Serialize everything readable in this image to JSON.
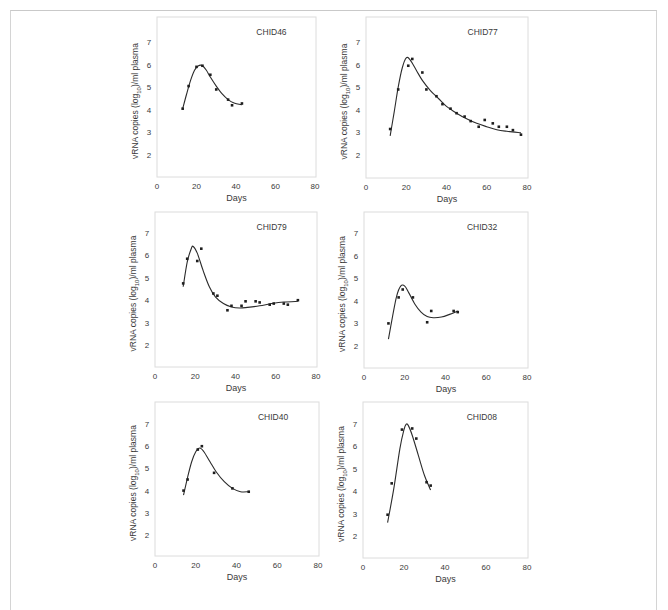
{
  "figure": {
    "xlabel": "Days",
    "ylabel_prefix": "vRNA copies (log",
    "ylabel_sub": "10",
    "ylabel_suffix": ")/ml plasma"
  },
  "chart_data": [
    {
      "type": "scatter",
      "title": "CHID46",
      "xlabel": "Days",
      "ylabel": "vRNA copies (log10)/ml plasma",
      "xlim": [
        0,
        80
      ],
      "ylim": [
        1,
        8
      ],
      "xticks": [
        0,
        20,
        40,
        60,
        80
      ],
      "yticks": [
        2,
        3,
        4,
        5,
        6,
        7
      ],
      "grid": false,
      "points": [
        [
          13,
          4.05
        ],
        [
          16,
          5.05
        ],
        [
          20,
          5.9
        ],
        [
          23,
          5.95
        ],
        [
          27,
          5.55
        ],
        [
          30,
          4.9
        ],
        [
          36,
          4.45
        ],
        [
          38,
          4.2
        ],
        [
          43,
          4.28
        ]
      ],
      "fit": [
        [
          13,
          4.05
        ],
        [
          15,
          4.7
        ],
        [
          17,
          5.3
        ],
        [
          19,
          5.75
        ],
        [
          21,
          5.95
        ],
        [
          23,
          5.95
        ],
        [
          25,
          5.75
        ],
        [
          27,
          5.45
        ],
        [
          30,
          5.05
        ],
        [
          33,
          4.7
        ],
        [
          36,
          4.45
        ],
        [
          39,
          4.3
        ],
        [
          43,
          4.22
        ]
      ]
    },
    {
      "type": "scatter",
      "title": "CHID77",
      "xlabel": "Days",
      "ylabel": "vRNA copies (log10)/ml plasma",
      "xlim": [
        0,
        80
      ],
      "ylim": [
        1,
        8
      ],
      "xticks": [
        0,
        20,
        40,
        60,
        80
      ],
      "yticks": [
        2,
        3,
        4,
        5,
        6,
        7
      ],
      "grid": false,
      "points": [
        [
          12,
          3.15
        ],
        [
          16,
          4.9
        ],
        [
          21,
          5.95
        ],
        [
          23,
          6.25
        ],
        [
          28,
          5.65
        ],
        [
          30,
          4.9
        ],
        [
          35,
          4.6
        ],
        [
          38,
          4.25
        ],
        [
          42,
          4.05
        ],
        [
          45,
          3.85
        ],
        [
          49,
          3.7
        ],
        [
          52,
          3.5
        ],
        [
          56,
          3.25
        ],
        [
          59,
          3.55
        ],
        [
          63,
          3.4
        ],
        [
          66,
          3.25
        ],
        [
          70,
          3.25
        ],
        [
          73,
          3.1
        ],
        [
          77,
          2.9
        ]
      ],
      "fit": [
        [
          12,
          2.85
        ],
        [
          14,
          3.9
        ],
        [
          16,
          5.0
        ],
        [
          18,
          5.85
        ],
        [
          20,
          6.3
        ],
        [
          22,
          6.2
        ],
        [
          25,
          5.75
        ],
        [
          28,
          5.3
        ],
        [
          32,
          4.85
        ],
        [
          36,
          4.5
        ],
        [
          40,
          4.15
        ],
        [
          45,
          3.85
        ],
        [
          50,
          3.6
        ],
        [
          55,
          3.4
        ],
        [
          60,
          3.25
        ],
        [
          65,
          3.12
        ],
        [
          70,
          3.05
        ],
        [
          77,
          2.98
        ]
      ]
    },
    {
      "type": "scatter",
      "title": "CHID79",
      "xlabel": "Days",
      "ylabel": "vRNA copies (log10)/ml plasma",
      "xlim": [
        0,
        80
      ],
      "ylim": [
        1,
        8
      ],
      "xticks": [
        0,
        20,
        40,
        60,
        80
      ],
      "yticks": [
        2,
        3,
        4,
        5,
        6,
        7
      ],
      "grid": false,
      "points": [
        [
          14,
          4.75
        ],
        [
          16,
          5.85
        ],
        [
          21,
          5.75
        ],
        [
          23,
          6.3
        ],
        [
          29,
          4.3
        ],
        [
          31,
          4.2
        ],
        [
          36,
          3.55
        ],
        [
          38,
          3.75
        ],
        [
          43,
          3.75
        ],
        [
          45,
          3.95
        ],
        [
          50,
          3.95
        ],
        [
          52,
          3.9
        ],
        [
          57,
          3.8
        ],
        [
          59,
          3.85
        ],
        [
          64,
          3.85
        ],
        [
          66,
          3.8
        ],
        [
          71,
          4.0
        ]
      ],
      "fit": [
        [
          14,
          4.6
        ],
        [
          16,
          5.7
        ],
        [
          18,
          6.3
        ],
        [
          19,
          6.4
        ],
        [
          21,
          6.1
        ],
        [
          24,
          5.3
        ],
        [
          27,
          4.6
        ],
        [
          30,
          4.15
        ],
        [
          34,
          3.85
        ],
        [
          38,
          3.7
        ],
        [
          42,
          3.65
        ],
        [
          46,
          3.68
        ],
        [
          52,
          3.75
        ],
        [
          58,
          3.85
        ],
        [
          64,
          3.92
        ],
        [
          71,
          3.95
        ]
      ]
    },
    {
      "type": "scatter",
      "title": "CHID32",
      "xlabel": "Days",
      "ylabel": "vRNA copies (log10)/ml plasma",
      "xlim": [
        0,
        80
      ],
      "ylim": [
        1,
        8
      ],
      "xticks": [
        0,
        20,
        40,
        60,
        80
      ],
      "yticks": [
        2,
        3,
        4,
        5,
        6,
        7
      ],
      "grid": false,
      "points": [
        [
          12,
          3.0
        ],
        [
          17,
          4.15
        ],
        [
          19,
          4.5
        ],
        [
          24,
          4.15
        ],
        [
          31,
          3.05
        ],
        [
          33,
          3.55
        ],
        [
          44,
          3.55
        ],
        [
          46,
          3.5
        ]
      ],
      "fit": [
        [
          12,
          2.3
        ],
        [
          14,
          3.3
        ],
        [
          16,
          4.2
        ],
        [
          18,
          4.65
        ],
        [
          20,
          4.65
        ],
        [
          22,
          4.35
        ],
        [
          25,
          3.85
        ],
        [
          28,
          3.5
        ],
        [
          31,
          3.3
        ],
        [
          34,
          3.25
        ],
        [
          38,
          3.28
        ],
        [
          42,
          3.4
        ],
        [
          46,
          3.55
        ]
      ]
    },
    {
      "type": "scatter",
      "title": "CHID40",
      "xlabel": "Days",
      "ylabel": "vRNA copies (log10)/ml plasma",
      "xlim": [
        0,
        80
      ],
      "ylim": [
        1,
        8
      ],
      "xticks": [
        0,
        20,
        40,
        60,
        80
      ],
      "yticks": [
        2,
        3,
        4,
        5,
        6,
        7
      ],
      "grid": false,
      "points": [
        [
          14,
          4.0
        ],
        [
          16,
          4.5
        ],
        [
          21,
          5.85
        ],
        [
          23,
          6.0
        ],
        [
          29,
          4.8
        ],
        [
          38,
          4.1
        ],
        [
          46,
          3.95
        ]
      ],
      "fit": [
        [
          14,
          3.8
        ],
        [
          16,
          4.6
        ],
        [
          18,
          5.3
        ],
        [
          20,
          5.75
        ],
        [
          22,
          5.92
        ],
        [
          24,
          5.75
        ],
        [
          27,
          5.3
        ],
        [
          30,
          4.85
        ],
        [
          34,
          4.4
        ],
        [
          38,
          4.1
        ],
        [
          42,
          3.95
        ],
        [
          46,
          3.95
        ]
      ]
    },
    {
      "type": "scatter",
      "title": "CHID08",
      "xlabel": "Days",
      "ylabel": "vRNA copies (log10)/ml plasma",
      "xlim": [
        0,
        80
      ],
      "ylim": [
        1,
        8
      ],
      "xticks": [
        0,
        20,
        40,
        60,
        80
      ],
      "yticks": [
        2,
        3,
        4,
        5,
        6,
        7
      ],
      "grid": false,
      "points": [
        [
          12,
          2.95
        ],
        [
          14,
          4.35
        ],
        [
          19,
          6.75
        ],
        [
          24,
          6.8
        ],
        [
          26,
          6.35
        ],
        [
          31,
          4.4
        ],
        [
          33,
          4.25
        ]
      ],
      "fit": [
        [
          12,
          2.6
        ],
        [
          15,
          4.1
        ],
        [
          18,
          5.9
        ],
        [
          20,
          6.75
        ],
        [
          21,
          6.98
        ],
        [
          22,
          6.95
        ],
        [
          24,
          6.5
        ],
        [
          27,
          5.6
        ],
        [
          30,
          4.7
        ],
        [
          33,
          4.05
        ]
      ]
    }
  ],
  "layout": {
    "panels": [
      {
        "x0": 157,
        "x80": 315,
        "ytop": 17,
        "ybottom": 177,
        "y7": 42,
        "y2": 155,
        "ylabel_x": 138
      },
      {
        "x0": 366,
        "x80": 527,
        "ytop": 17,
        "ybottom": 178,
        "y7": 42,
        "y2": 155,
        "ylabel_x": 347
      },
      {
        "x0": 155,
        "x80": 316,
        "ytop": 212,
        "ybottom": 367,
        "y7": 233,
        "y2": 345,
        "ylabel_x": 136
      },
      {
        "x0": 364,
        "x80": 527,
        "ytop": 212,
        "ybottom": 368,
        "y7": 233,
        "y2": 346,
        "ylabel_x": 345
      },
      {
        "x0": 155,
        "x80": 318,
        "ytop": 402,
        "ybottom": 556,
        "y7": 424,
        "y2": 535,
        "ylabel_x": 136
      },
      {
        "x0": 363,
        "x80": 527,
        "ytop": 402,
        "ybottom": 558,
        "y7": 424,
        "y2": 536,
        "ylabel_x": 344
      }
    ]
  }
}
